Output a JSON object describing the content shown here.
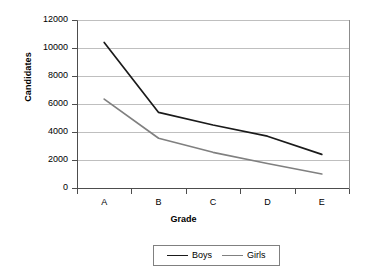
{
  "chart_data": {
    "type": "line",
    "title": "",
    "xlabel": "Grade",
    "ylabel": "Candidates",
    "categories": [
      "A",
      "B",
      "C",
      "D",
      "E"
    ],
    "series": [
      {
        "name": "Boys",
        "color": "#1a1a1a",
        "values": [
          10400,
          5400,
          4500,
          3700,
          2400
        ]
      },
      {
        "name": "Girls",
        "color": "#808080",
        "values": [
          6350,
          3550,
          2550,
          1750,
          1000
        ]
      }
    ],
    "ylim": [
      0,
      12000
    ],
    "yticks": [
      0,
      2000,
      4000,
      6000,
      8000,
      10000,
      12000
    ],
    "ytick_labels": [
      "0",
      "2000",
      "4000",
      "6000",
      "8000",
      "10000",
      "12000"
    ],
    "grid": true,
    "grid_axis": "y",
    "legend_position": "bottom"
  },
  "axes": {
    "y_title": "Candidates",
    "x_title": "Grade"
  },
  "legend": {
    "entries": [
      {
        "label": "Boys",
        "color": "#1a1a1a"
      },
      {
        "label": "Girls",
        "color": "#808080"
      }
    ]
  },
  "colors": {
    "boys": "#1a1a1a",
    "girls": "#808080",
    "gridline": "#bfbfbf",
    "axis": "#4d4d4d",
    "background": "#ffffff"
  }
}
